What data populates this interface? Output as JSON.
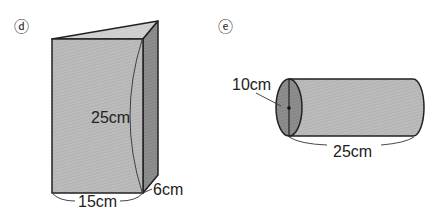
{
  "figures": [
    {
      "id": "d",
      "marker": "ⓓ",
      "shape": "triangular prism",
      "dimensions": {
        "height": "25cm",
        "base": "15cm",
        "depth": "6cm"
      }
    },
    {
      "id": "e",
      "marker": "ⓔ",
      "shape": "cylinder",
      "dimensions": {
        "diameter": "10cm",
        "length": "25cm"
      }
    }
  ],
  "colors": {
    "front_face": "#b9b9b9",
    "top_face": "#cfcfcf",
    "side_face": "#8a8a8a",
    "cylinder_body": "#bdbdbd",
    "cylinder_end": "#8c8c8c",
    "stroke": "#222222"
  }
}
